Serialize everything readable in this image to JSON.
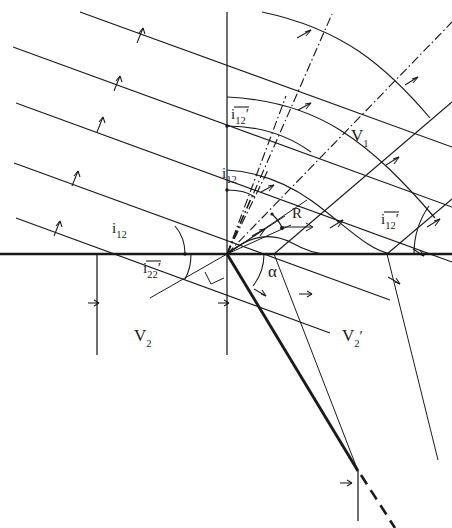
{
  "figure": {
    "type": "seismic-wavefront-refraction-diagram",
    "background": "#ffffff",
    "ink_color": "#1a1a1a"
  },
  "labels": {
    "incident_angle_left": {
      "base": "i",
      "sub": "12",
      "prime": "",
      "overbar": false,
      "text": "i12",
      "x": 112,
      "y": 233
    },
    "incident_angle_upper": {
      "base": "i",
      "sub": "12",
      "prime": "",
      "overbar": false,
      "text": "i12",
      "x": 222,
      "y": 178
    },
    "transmitted_angle_upper": {
      "base": "i",
      "sub": "12",
      "prime": "′",
      "overbar": true,
      "text": "ī12′",
      "x": 231,
      "y": 119
    },
    "transmitted_angle_right": {
      "base": "i",
      "sub": "12",
      "prime": "′",
      "overbar": true,
      "text": "ī12′",
      "x": 381,
      "y": 224
    },
    "reflected_angle_lower": {
      "base": "i",
      "sub": "22",
      "prime": "′",
      "overbar": true,
      "text": "ī22′",
      "x": 143,
      "y": 273
    },
    "velocity_v1": {
      "base": "V",
      "sub": "1",
      "prime": "",
      "overbar": false,
      "text": "V1",
      "x": 351,
      "y": 141
    },
    "velocity_v2": {
      "base": "V",
      "sub": "2",
      "prime": "",
      "overbar": false,
      "text": "V2",
      "x": 134,
      "y": 341
    },
    "velocity_v2_prime": {
      "base": "V",
      "sub": "2",
      "prime": "′",
      "overbar": false,
      "text": "V2′",
      "x": 342,
      "y": 341
    },
    "ray_vector_R": {
      "base": "R",
      "sub": "",
      "prime": "",
      "overbar": false,
      "text": "R",
      "x": 292,
      "y": 218
    },
    "alpha_angle": {
      "base": "α",
      "sub": "",
      "prime": "",
      "overbar": false,
      "text": "α",
      "x": 268,
      "y": 277
    }
  },
  "geometry": {
    "origin": {
      "x": 227,
      "y": 254
    },
    "interface_y": 254,
    "vertical_axis_x": 227,
    "incident_wavefront_angle_deg": 20,
    "note_right_angle_marker": true
  }
}
